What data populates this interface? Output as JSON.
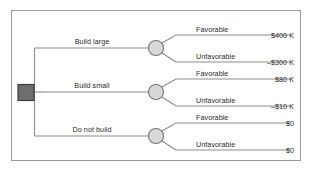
{
  "figure": {
    "type": "decision-tree",
    "title": "",
    "background_color": "#ffffff",
    "frame_color": "#9a9a9a",
    "line_color": "#8c8c8c",
    "text_color": "#2b2b2b",
    "decision_node_fill": "#6e6e6e",
    "decision_node_stroke": "#3d3d3d",
    "chance_node_fill": "#d8d8d8",
    "chance_node_stroke": "#7a7a7a"
  },
  "decision_node": {
    "label": "",
    "shape": "square"
  },
  "branches": [
    {
      "id": "build-large",
      "label": "Build large",
      "chance_node_shape": "circle",
      "outcomes": [
        {
          "label": "Favorable",
          "payoff": "$400 K"
        },
        {
          "label": "Unfavorable",
          "payoff": "–$300 K"
        }
      ]
    },
    {
      "id": "build-small",
      "label": "Build small",
      "chance_node_shape": "circle",
      "outcomes": [
        {
          "label": "Favorable",
          "payoff": "$80 K"
        },
        {
          "label": "Unfavorable",
          "payoff": "–$10 K"
        }
      ]
    },
    {
      "id": "do-not-build",
      "label": "Do not build",
      "chance_node_shape": "circle",
      "outcomes": [
        {
          "label": "Favorable",
          "payoff": "$0"
        },
        {
          "label": "Unfavorable",
          "payoff": "$0"
        }
      ]
    }
  ]
}
